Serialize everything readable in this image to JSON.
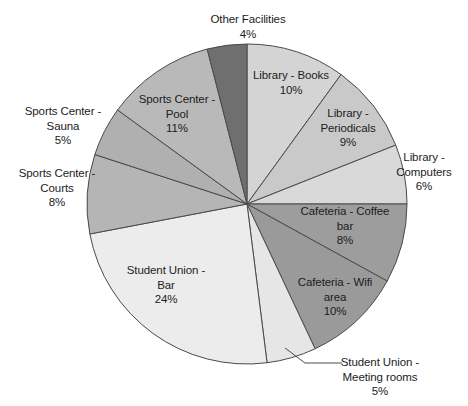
{
  "chart_data": {
    "type": "pie",
    "title": "",
    "subtitle": "",
    "xlabel": "",
    "ylabel": "",
    "legend_position": "none",
    "grid": false,
    "labels_show_percent": true,
    "units": "percent",
    "total": 100,
    "categories": [
      "Library - Books",
      "Library - Periodicals",
      "Library - Computers",
      "Cafeteria - Coffee bar",
      "Cafeteria - Wifi area",
      "Student Union - Meeting rooms",
      "Student Union - Bar",
      "Sports Center - Courts",
      "Sports Center - Sauna",
      "Sports Center - Pool",
      "Other Facilities"
    ],
    "values": [
      10,
      9,
      6,
      8,
      10,
      5,
      24,
      8,
      5,
      11,
      4
    ],
    "value_labels": [
      "10%",
      "9%",
      "6%",
      "8%",
      "10%",
      "5%",
      "24%",
      "8%",
      "5%",
      "11%",
      "4%"
    ],
    "colors": [
      "#d4d4d4",
      "#c9c9c9",
      "#d9d9d9",
      "#9d9d9d",
      "#9a9a9a",
      "#e6e6e6",
      "#ececec",
      "#b5b5b5",
      "#b0b0b0",
      "#b9b9b9",
      "#6f6f6f"
    ],
    "slice_border_color": "#4a4a4a",
    "background": "#ffffff",
    "start_angle_deg": 0,
    "direction": "clockwise"
  },
  "labels": [
    {
      "name": "Other Facilities",
      "value": "4%",
      "line1": "Other Facilities",
      "line2": "",
      "value_line": "4%"
    },
    {
      "name": "Library - Books",
      "value": "10%",
      "line1": "Library - Books",
      "line2": "",
      "value_line": "10%"
    },
    {
      "name": "Library - Periodicals",
      "value": "9%",
      "line1": "Library -",
      "line2": "Periodicals",
      "value_line": "9%"
    },
    {
      "name": "Library - Computers",
      "value": "6%",
      "line1": "Library -",
      "line2": "Computers",
      "value_line": "6%"
    },
    {
      "name": "Cafeteria - Coffee bar",
      "value": "8%",
      "line1": "Cafeteria - Coffee",
      "line2": "bar",
      "value_line": "8%"
    },
    {
      "name": "Cafeteria - Wifi area",
      "value": "10%",
      "line1": "Cafeteria - Wifi",
      "line2": "area",
      "value_line": "10%"
    },
    {
      "name": "Student Union - Meeting rooms",
      "value": "5%",
      "line1": "Student Union -",
      "line2": "Meeting rooms",
      "value_line": "5%"
    },
    {
      "name": "Student Union - Bar",
      "value": "24%",
      "line1": "Student Union -",
      "line2": "Bar",
      "value_line": "24%"
    },
    {
      "name": "Sports Center - Courts",
      "value": "8%",
      "line1": "Sports Center -",
      "line2": "Courts",
      "value_line": "8%"
    },
    {
      "name": "Sports Center - Sauna",
      "value": "5%",
      "line1": "Sports Center -",
      "line2": "Sauna",
      "value_line": "5%"
    },
    {
      "name": "Sports Center - Pool",
      "value": "11%",
      "line1": "Sports Center -",
      "line2": "Pool",
      "value_line": "11%"
    }
  ],
  "geometry": {
    "center_x": 247,
    "center_y": 204,
    "radius": 160,
    "leader_line_color": "#4a4a4a"
  }
}
